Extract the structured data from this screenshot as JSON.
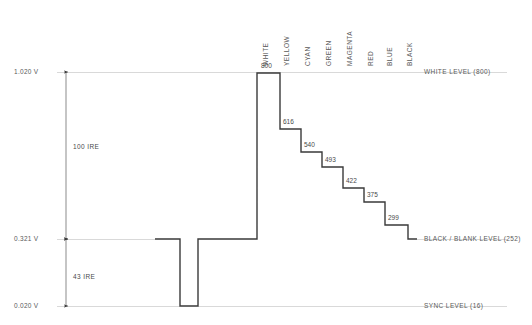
{
  "figure": {
    "trace_color": "#3a3a3a",
    "grid_color": "#d9d9d9",
    "text_color": "#5a5a5a"
  },
  "voltage_axis": {
    "ticks": [
      {
        "label": "1.020 V",
        "y": 72
      },
      {
        "label": "0.321 V",
        "y": 239
      },
      {
        "label": "0.020 V",
        "y": 306
      }
    ]
  },
  "ire_spans": [
    {
      "label": "100  IRE",
      "y": 146
    },
    {
      "label": "43  IRE",
      "y": 276
    }
  ],
  "level_labels": [
    {
      "label": "WHITE LEVEL (800)",
      "y": 72
    },
    {
      "label": "BLACK / BLANK LEVEL (252)",
      "y": 239
    },
    {
      "label": "SYNC LEVEL (16)",
      "y": 306
    }
  ],
  "column_headers": [
    {
      "label": "WHITE",
      "x": 267
    },
    {
      "x": 288,
      "label": "YELLOW"
    },
    {
      "label": "CYAN",
      "x": 309
    },
    {
      "label": "GREEN",
      "x": 330
    },
    {
      "label": "MAGENTA",
      "x": 351
    },
    {
      "label": "RED",
      "x": 372
    },
    {
      "label": "BLUE",
      "x": 391
    },
    {
      "label": "BLACK",
      "x": 411
    }
  ],
  "chart_data": {
    "type": "line",
    "xlabel": "",
    "ylabel": "Voltage / digital level",
    "grid": true,
    "legend": "none",
    "y_reference_levels": [
      {
        "name": "WHITE LEVEL",
        "digital": 800,
        "volts": 1.02,
        "ire": 100
      },
      {
        "name": "BLACK / BLANK LEVEL",
        "digital": 252,
        "volts": 0.321,
        "ire": 0
      },
      {
        "name": "SYNC LEVEL",
        "digital": 16,
        "volts": 0.02,
        "ire": -43
      }
    ],
    "ire_annotations": [
      {
        "label": "100  IRE",
        "from": "BLACK / BLANK LEVEL",
        "to": "WHITE LEVEL"
      },
      {
        "label": "43  IRE",
        "from": "SYNC LEVEL",
        "to": "BLACK / BLANK LEVEL"
      }
    ],
    "categories": [
      "WHITE",
      "YELLOW",
      "CYAN",
      "GREEN",
      "MAGENTA",
      "RED",
      "BLUE",
      "BLACK"
    ],
    "values": [
      800,
      616,
      540,
      493,
      422,
      375,
      299,
      252
    ],
    "value_labels": [
      "800",
      "616",
      "540",
      "493",
      "422",
      "375",
      "299",
      ""
    ],
    "sync_pulse": {
      "level_name": "SYNC LEVEL",
      "digital": 16,
      "volts": 0.02
    }
  },
  "geometry": {
    "trace_path": "M155,239 L180,239 L180,306 L198,306 L198,239 L257,239 L257,73 L280,73 L280,129 L301,129 L301,152 L322,152 L322,167 L343,167 L343,188 L364,188 L364,202 L385,202 L385,225 L408,225 L408,239 L417,239",
    "grid_right": 417,
    "arrow_x": 66
  },
  "caption": {
    "bottom_text": ""
  }
}
